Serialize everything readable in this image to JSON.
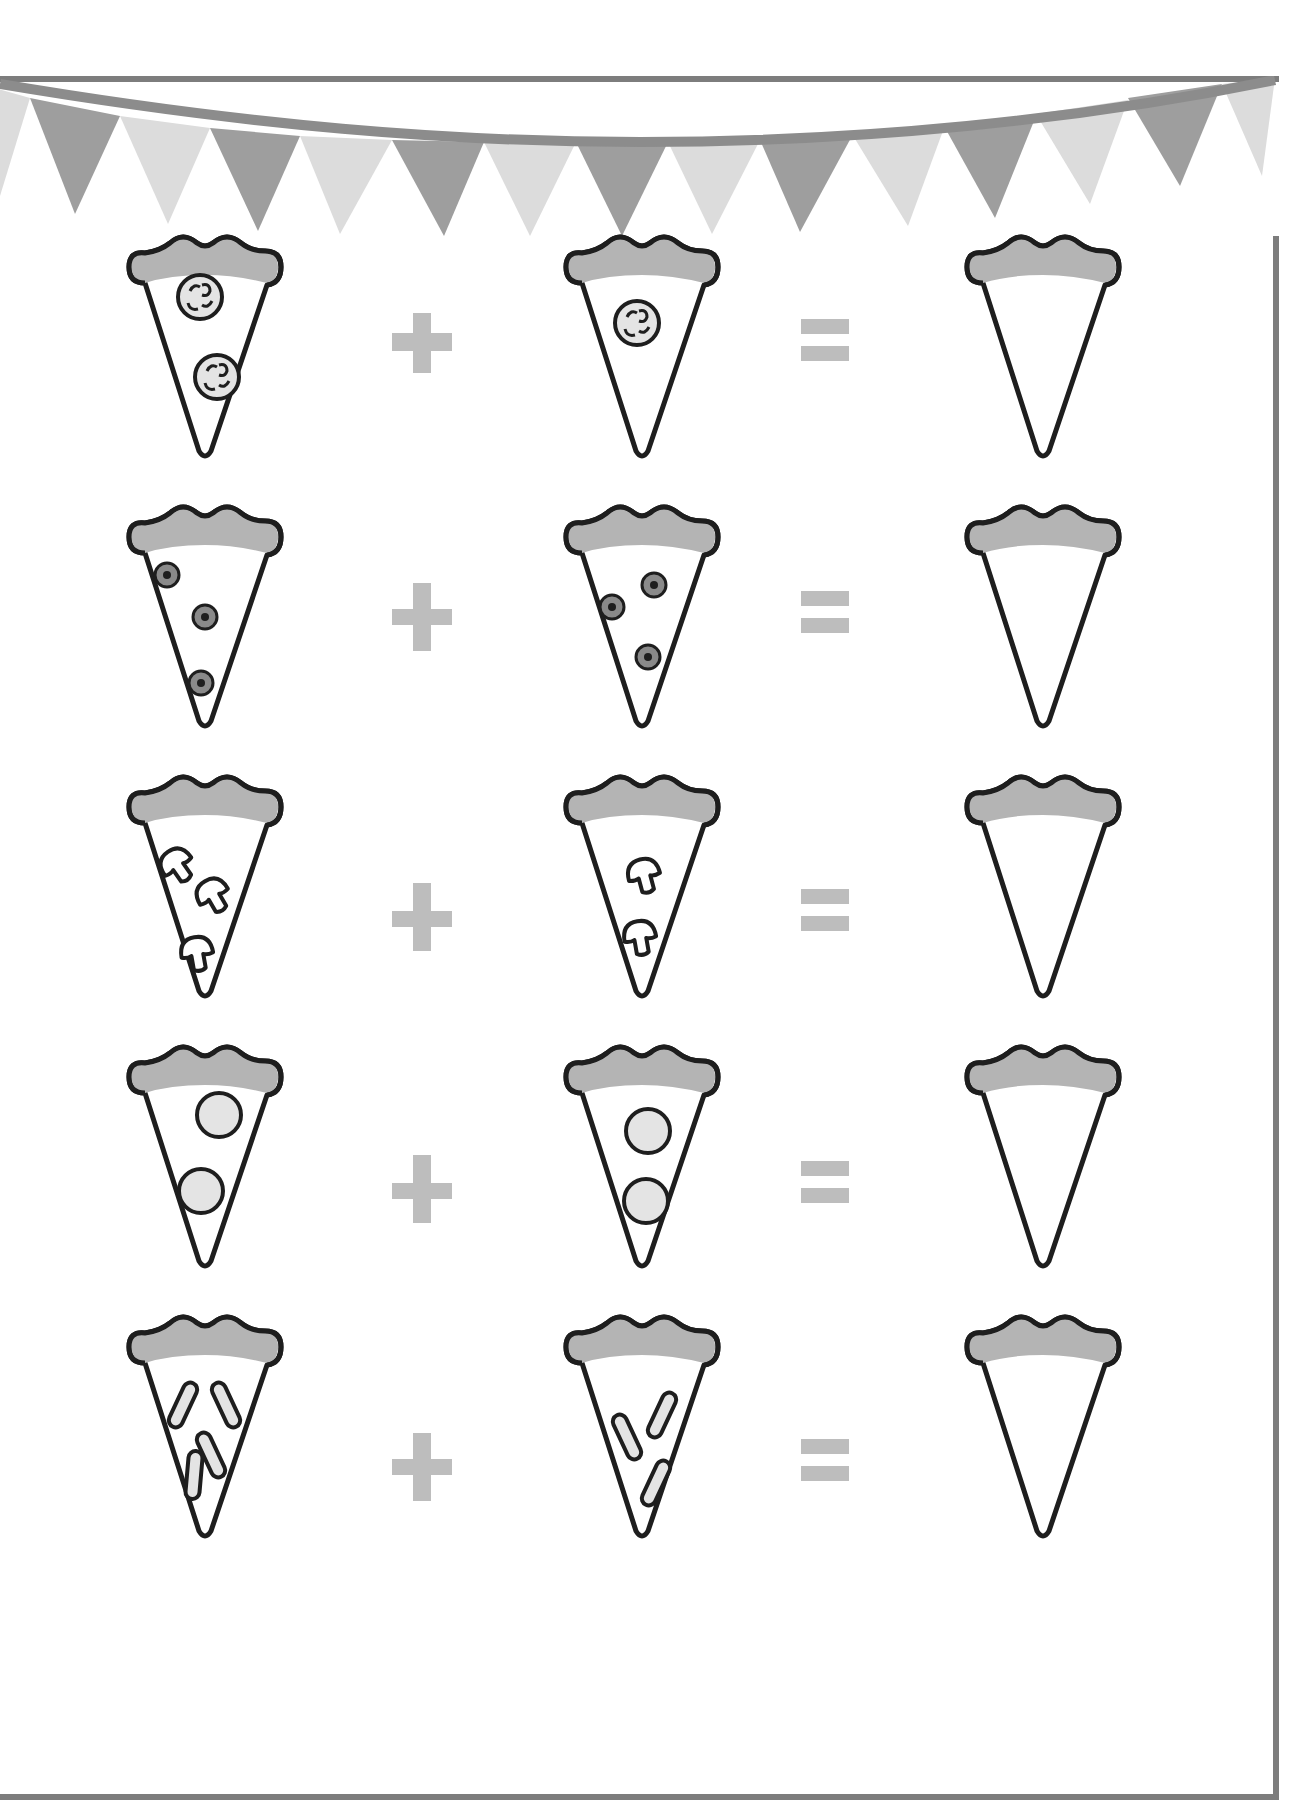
{
  "worksheet": {
    "title": "Pizza slice addition worksheet",
    "colors": {
      "frame": "#7d7d7d",
      "bunting_dark": "#9e9e9e",
      "bunting_light": "#dcdcdc",
      "crust": "#b4b4b4",
      "outline": "#1e1e1e",
      "operator": "#bdbdbd",
      "topping_fill": "#e4e4e4",
      "olive": "#8a8a8a"
    },
    "bunting_flags": 14,
    "operators": {
      "plus": "+",
      "equals": "="
    },
    "rows": [
      {
        "topping": "tomato",
        "left_count": 2,
        "right_count": 1,
        "answer": ""
      },
      {
        "topping": "olive",
        "left_count": 3,
        "right_count": 3,
        "answer": ""
      },
      {
        "topping": "mushroom",
        "left_count": 3,
        "right_count": 2,
        "answer": ""
      },
      {
        "topping": "salami",
        "left_count": 2,
        "right_count": 2,
        "answer": ""
      },
      {
        "topping": "pepper-strip",
        "left_count": 4,
        "right_count": 3,
        "answer": ""
      }
    ]
  }
}
